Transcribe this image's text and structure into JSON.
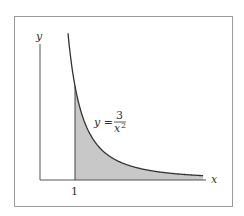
{
  "chart_data": {
    "type": "area",
    "title": "",
    "xlabel": "x",
    "ylabel": "y",
    "function": "y = 3/x^2",
    "annotation": {
      "text_left": "y =",
      "numerator": "3",
      "denominator": "x",
      "exponent": "2"
    },
    "x_ticks": [
      "1"
    ],
    "shaded_region": {
      "from_x": 1,
      "to_x": "end of curve",
      "under": "y = 3/x^2"
    },
    "x": [
      0.8,
      1,
      1.5,
      2,
      2.5,
      3,
      3.5,
      4,
      4.66
    ],
    "values": [
      4.69,
      3,
      1.33,
      0.75,
      0.48,
      0.33,
      0.24,
      0.19,
      0.14
    ],
    "grid": false,
    "colors": {
      "curve": "#333333",
      "fill": "#c8c8c8",
      "axes": "#555555",
      "frame": "#9a9a9a"
    }
  }
}
